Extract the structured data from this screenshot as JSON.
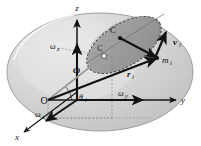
{
  "figure": {
    "name": "rigid-body-rotation-diagram",
    "kind": "vector-mechanics-diagram",
    "canvas": {
      "width": 201,
      "height": 146,
      "background": "#ffffff"
    }
  },
  "colors": {
    "body_fill": "#c9c9c9",
    "body_edge": "#8f8f8f",
    "body_highlight": "#e2e2e2",
    "plane_fill": "#9a9a9a",
    "plane_edge": "#4a4a4a",
    "vector_stroke": "#121212",
    "axis_stroke": "#161616",
    "dashed_stroke": "#6a6a6a",
    "thin_stroke": "#7a7a7a",
    "label_color": "#151515"
  },
  "axes": [
    {
      "id": "z",
      "label": "z",
      "label_sub": "",
      "direction": "up",
      "x": 77,
      "y": 11
    },
    {
      "id": "y",
      "label": "y",
      "label_sub": "",
      "direction": "right",
      "x": 183,
      "y": 99
    },
    {
      "id": "x",
      "label": "x",
      "label_sub": "",
      "direction": "lower-left",
      "x": 17,
      "y": 137
    }
  ],
  "points": [
    {
      "id": "origin",
      "label": "O",
      "label_sub": "",
      "x": 48,
      "y": 100,
      "italic": false
    },
    {
      "id": "center-of-mass",
      "label": "C",
      "label_sub": "",
      "x": 116,
      "y": 35,
      "italic": false
    },
    {
      "id": "omega-tip-marker",
      "label": "C",
      "label_sub": "",
      "x": 103,
      "y": 54,
      "italic": false
    },
    {
      "id": "mass-element",
      "label": "m",
      "label_sub": "i",
      "x": 163,
      "y": 59,
      "italic": true
    }
  ],
  "vectors": [
    {
      "id": "omega",
      "label": "ω",
      "label_sub": "",
      "bold": true,
      "x": 77,
      "y": 70,
      "description": "resultant angular velocity vector"
    },
    {
      "id": "omega-x",
      "label": "ω",
      "label_sub": "x",
      "bold": false,
      "x": 42,
      "y": 114,
      "description": "angular velocity x component"
    },
    {
      "id": "omega-y",
      "label": "ω",
      "label_sub": "y",
      "bold": false,
      "x": 124,
      "y": 94,
      "description": "angular velocity y component"
    },
    {
      "id": "omega-z",
      "label": "ω",
      "label_sub": "z",
      "bold": false,
      "x": 56,
      "y": 47,
      "description": "angular velocity z component"
    },
    {
      "id": "r-i",
      "label": "r",
      "label_sub": "i",
      "bold": true,
      "x": 131,
      "y": 74,
      "description": "position vector to mass element"
    },
    {
      "id": "v-i",
      "label": "v",
      "label_sub": "i",
      "bold": true,
      "x": 177,
      "y": 42,
      "description": "velocity of mass element"
    }
  ],
  "angles": [
    {
      "id": "theta-i",
      "label": "θ",
      "label_sub": "i",
      "x": 83,
      "y": 98,
      "description": "angle between omega axis and y axis"
    }
  ]
}
